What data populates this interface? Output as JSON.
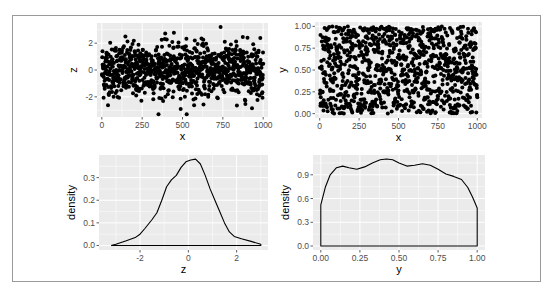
{
  "figure": {
    "background": "#ffffff",
    "panel_background": "#ebebeb",
    "grid_color": "#ffffff",
    "point_color": "#000000",
    "line_color": "#000000"
  },
  "chart_data": [
    {
      "id": "scatter-x-z",
      "type": "scatter",
      "xlabel": "x",
      "ylabel": "z",
      "xlim": [
        -30,
        1030
      ],
      "ylim": [
        -3.5,
        3.5
      ],
      "x_ticks": [
        0,
        250,
        500,
        750,
        1000
      ],
      "x_tick_labels": [
        "0",
        "250",
        "500",
        "750",
        "1000"
      ],
      "y_ticks": [
        -2,
        0,
        2
      ],
      "y_tick_labels": [
        "-2",
        "0",
        "2"
      ],
      "n_points": 1000,
      "description": "x = 1..1000 index, z ~ Normal(0,1); points dense between -2 and 2 with outliers near ±3",
      "grid": true
    },
    {
      "id": "scatter-x-y",
      "type": "scatter",
      "xlabel": "x",
      "ylabel": "y",
      "xlim": [
        -30,
        1030
      ],
      "ylim": [
        -0.05,
        1.05
      ],
      "x_ticks": [
        0,
        250,
        500,
        750,
        1000
      ],
      "x_tick_labels": [
        "0",
        "250",
        "500",
        "750",
        "1000"
      ],
      "y_ticks": [
        0,
        0.25,
        0.5,
        0.75,
        1.0
      ],
      "y_tick_labels": [
        "0.00",
        "0.25",
        "0.50",
        "0.75",
        "1.00"
      ],
      "n_points": 1000,
      "description": "x = 1..1000 index, y ~ Uniform(0,1); points fill the panel evenly",
      "grid": true
    },
    {
      "id": "density-z",
      "type": "line",
      "xlabel": "z",
      "ylabel": "density",
      "xlim": [
        -3.7,
        3.3
      ],
      "ylim": [
        -0.02,
        0.4
      ],
      "x_ticks": [
        -2,
        0,
        2
      ],
      "x_tick_labels": [
        "-2",
        "0",
        "2"
      ],
      "y_ticks": [
        0,
        0.1,
        0.2,
        0.3
      ],
      "y_tick_labels": [
        "0.0",
        "0.1",
        "0.2",
        "0.3"
      ],
      "x": [
        -3.2,
        -3.0,
        -2.6,
        -2.2,
        -2.0,
        -1.8,
        -1.5,
        -1.3,
        -1.1,
        -0.9,
        -0.7,
        -0.5,
        -0.3,
        -0.1,
        0.1,
        0.3,
        0.5,
        0.7,
        0.9,
        1.1,
        1.3,
        1.5,
        1.7,
        1.9,
        2.2,
        2.6,
        3.0
      ],
      "y": [
        0.0,
        0.005,
        0.02,
        0.035,
        0.05,
        0.075,
        0.115,
        0.145,
        0.2,
        0.26,
        0.29,
        0.31,
        0.345,
        0.37,
        0.378,
        0.382,
        0.36,
        0.31,
        0.25,
        0.2,
        0.15,
        0.1,
        0.06,
        0.04,
        0.03,
        0.018,
        0.005
      ],
      "grid": true
    },
    {
      "id": "density-y",
      "type": "line",
      "xlabel": "y",
      "ylabel": "density",
      "xlim": [
        -0.05,
        1.05
      ],
      "ylim": [
        -0.05,
        1.15
      ],
      "x_ticks": [
        0,
        0.25,
        0.5,
        0.75,
        1.0
      ],
      "x_tick_labels": [
        "0.00",
        "0.25",
        "0.50",
        "0.75",
        "1.00"
      ],
      "y_ticks": [
        0,
        0.3,
        0.6,
        0.9
      ],
      "y_tick_labels": [
        "0.0",
        "0.3",
        "0.6",
        "0.9"
      ],
      "x": [
        0.0,
        0.0,
        0.03,
        0.06,
        0.1,
        0.14,
        0.18,
        0.23,
        0.28,
        0.33,
        0.38,
        0.42,
        0.46,
        0.5,
        0.55,
        0.6,
        0.65,
        0.7,
        0.75,
        0.8,
        0.85,
        0.9,
        0.94,
        0.97,
        1.0,
        1.0
      ],
      "y": [
        0.0,
        0.52,
        0.75,
        0.9,
        0.99,
        1.01,
        0.99,
        0.97,
        1.0,
        1.05,
        1.09,
        1.1,
        1.09,
        1.05,
        1.01,
        1.02,
        1.04,
        1.02,
        0.97,
        0.91,
        0.88,
        0.84,
        0.74,
        0.62,
        0.48,
        0.0
      ],
      "baseline": 0,
      "grid": true
    }
  ]
}
